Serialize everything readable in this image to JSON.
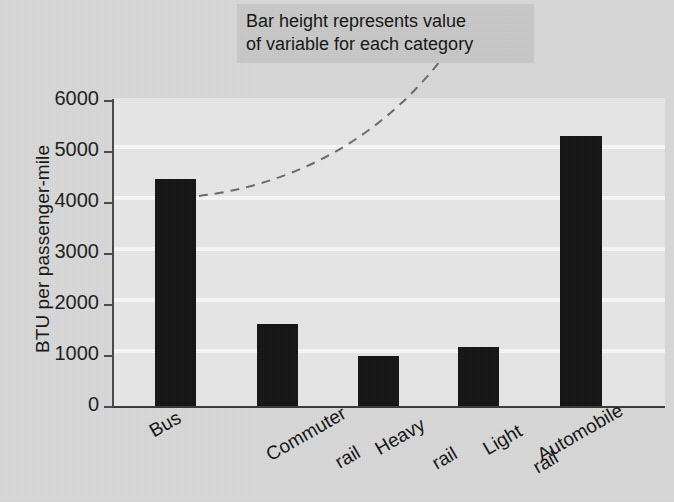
{
  "chart_data": {
    "type": "bar",
    "title": "",
    "subtitle": "",
    "xlabel": "",
    "ylabel": "BTU per passenger-mile",
    "categories": [
      "Bus",
      "Commuter\nrail",
      "Heavy\nrail",
      "Light\nrail",
      "Automobile"
    ],
    "category_labels_plain": [
      "Bus",
      "Commuter rail",
      "Heavy rail",
      "Light rail",
      "Automobile"
    ],
    "values": [
      4450,
      1600,
      980,
      1150,
      5300
    ],
    "ylim": [
      0,
      6000
    ],
    "yticks": [
      0,
      1000,
      2000,
      3000,
      4000,
      5000,
      6000
    ],
    "ytick_labels": [
      "0",
      "1000",
      "2000",
      "3000",
      "4000",
      "5000",
      "6000"
    ],
    "grid": true,
    "grid_axis": "y",
    "legend": false,
    "legend_position": "none",
    "bar_color": "#141414",
    "plot_background": "#e7e7e7",
    "figure_background": "#d8d8d8",
    "gridline_color": "#f7f7f7",
    "annotations": [
      {
        "text": "Bar height represents value\nof variable for each category",
        "style": "callout-box-with-dashed-leader",
        "points_to_category": "Bus"
      }
    ]
  },
  "annotation": {
    "text": "Bar height represents value\nof variable for each category"
  },
  "axes": {
    "y_title": "BTU per passenger-mile"
  },
  "ticks": {
    "y": [
      "6000",
      "5000",
      "4000",
      "3000",
      "2000",
      "1000",
      "0"
    ]
  },
  "categories": {
    "bus": "Bus",
    "commuter_rail_line1": "Commuter",
    "commuter_rail_line2": "rail",
    "heavy_rail_line1": "Heavy",
    "heavy_rail_line2": "rail",
    "light_rail_line1": "Light",
    "light_rail_line2": "rail",
    "automobile": "Automobile"
  },
  "colors": {
    "bar": "#141414",
    "plot_bg": "#e7e7e7",
    "figure_bg": "#d8d8d8",
    "gridline": "#f7f7f7",
    "annotation_bg": "#c8c8c8",
    "text": "#141414",
    "leader_line": "#6b6b6b"
  }
}
